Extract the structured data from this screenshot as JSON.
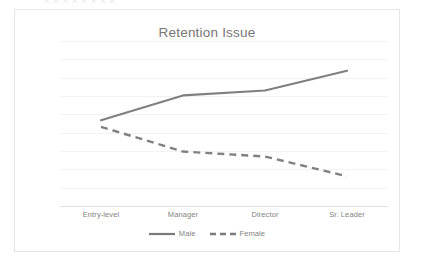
{
  "artifact": {
    "top_text": "x  x   x    x     x      x       x        x"
  },
  "chart": {
    "title": "Retention Issue"
  },
  "legend": {
    "items": [
      {
        "label": "Male",
        "style": "solid",
        "color": "#808080"
      },
      {
        "label": "Female",
        "style": "dashed",
        "color": "#808080"
      }
    ]
  },
  "chart_data": {
    "type": "line",
    "title": "Retention Issue",
    "xlabel": "",
    "ylabel": "",
    "categories": [
      "Entry-level",
      "Manager",
      "Director",
      "Sr. Leader"
    ],
    "series": [
      {
        "name": "Male",
        "values": [
          52,
          67,
          70,
          82
        ],
        "style": "solid",
        "color": "#808080"
      },
      {
        "name": "Female",
        "values": [
          48,
          33,
          30,
          18
        ],
        "style": "dashed",
        "color": "#808080"
      }
    ],
    "ylim": [
      0,
      100
    ],
    "grid": true,
    "gridlines": [
      10,
      20,
      30,
      40,
      50,
      60,
      70,
      80,
      90,
      100
    ],
    "legend_position": "bottom",
    "y_tick_labels_visible": false
  }
}
